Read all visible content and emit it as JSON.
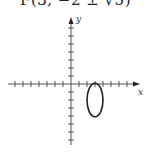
{
  "caption": "F(3, −2 ± √5)",
  "graph": {
    "x_label": "x",
    "y_label": "y",
    "origin_px": [
      71,
      84
    ],
    "unit_px": 8,
    "x_ticks": [
      -7,
      -6,
      -5,
      -4,
      -3,
      -2,
      -1,
      1,
      2,
      3,
      4,
      5,
      6,
      7
    ],
    "y_ticks": [
      -7,
      -6,
      -5,
      -4,
      -3,
      -2,
      -1,
      1,
      2,
      3,
      4,
      5,
      6,
      7
    ],
    "ellipse": {
      "center": [
        3,
        -2
      ],
      "semi_axis_x": 1,
      "semi_axis_y": 2.1,
      "orientation": "vertical"
    },
    "colors": {
      "axis": "#555555",
      "curve": "#222222"
    }
  }
}
